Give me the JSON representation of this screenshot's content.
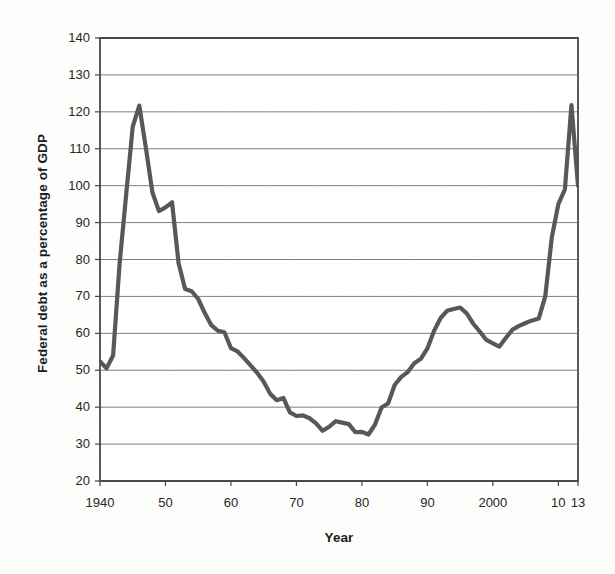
{
  "chart_data": {
    "type": "line",
    "title": "",
    "xlabel": "Year",
    "ylabel": "Federal debt as a percentage of GDP",
    "xlim": [
      1940,
      2013
    ],
    "ylim": [
      20,
      140
    ],
    "y_ticks": [
      20,
      30,
      40,
      50,
      60,
      70,
      80,
      90,
      100,
      110,
      120,
      130,
      140
    ],
    "y_tick_labels": [
      "20",
      "30",
      "40",
      "50",
      "60",
      "70",
      "80",
      "90",
      "100",
      "110",
      "120",
      "130",
      "140"
    ],
    "x_ticks": [
      1940,
      1950,
      1960,
      1970,
      1980,
      1990,
      2000,
      2010,
      2013
    ],
    "x_tick_labels": [
      "1940",
      "50",
      "60",
      "70",
      "80",
      "90",
      "2000",
      "10",
      "13"
    ],
    "grid": "horizontal",
    "legend": "none",
    "line_color": "#585856",
    "line_width": 4.2,
    "series": [
      {
        "name": "Federal debt as a percentage of GDP",
        "x": [
          1940,
          1941,
          1942,
          1943,
          1944,
          1945,
          1946,
          1947,
          1948,
          1949,
          1950,
          1951,
          1952,
          1953,
          1954,
          1955,
          1956,
          1957,
          1958,
          1959,
          1960,
          1961,
          1962,
          1963,
          1964,
          1965,
          1966,
          1967,
          1968,
          1969,
          1970,
          1971,
          1972,
          1973,
          1974,
          1975,
          1976,
          1977,
          1978,
          1979,
          1980,
          1981,
          1982,
          1983,
          1984,
          1985,
          1986,
          1987,
          1988,
          1989,
          1990,
          1991,
          1992,
          1993,
          1994,
          1995,
          1996,
          1997,
          1998,
          1999,
          2000,
          2001,
          2002,
          2003,
          2004,
          2005,
          2006,
          2007,
          2008,
          2009,
          2010,
          2011,
          2012,
          2013
        ],
        "values": [
          52.4,
          50.5,
          54.0,
          79.0,
          97.6,
          116.0,
          121.7,
          110.3,
          98.2,
          93.1,
          94.1,
          95.5,
          79.0,
          72.0,
          71.4,
          69.3,
          65.5,
          62.2,
          60.7,
          60.3,
          56.0,
          55.1,
          53.3,
          51.3,
          49.3,
          46.9,
          43.6,
          41.9,
          42.5,
          38.6,
          37.6,
          37.8,
          37.0,
          35.6,
          33.6,
          34.7,
          36.2,
          35.8,
          35.4,
          33.2,
          33.3,
          32.6,
          35.3,
          39.9,
          41.0,
          46.0,
          48.2,
          49.5,
          51.9,
          53.1,
          55.9,
          60.6,
          64.1,
          66.1,
          66.6,
          67.0,
          65.4,
          62.6,
          60.5,
          58.2,
          57.3,
          56.4,
          58.8,
          61.0,
          62.0,
          62.8,
          63.5,
          64.0,
          70.0,
          86.0,
          95.0,
          99.0,
          121.8,
          100.0
        ]
      }
    ]
  },
  "axes": {
    "y_title": "Federal debt as a percentage of GDP",
    "x_title": "Year"
  }
}
